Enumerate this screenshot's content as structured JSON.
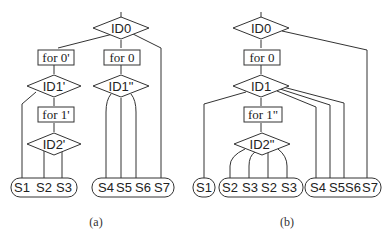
{
  "figure": {
    "a": {
      "caption": "(a)",
      "root": "ID0",
      "loops": [
        "for 0'",
        "for 0",
        "for 1'"
      ],
      "decisions": [
        "ID0",
        "ID1'",
        "ID1\"",
        "ID2'"
      ],
      "groups": [
        [
          "S1",
          "S2",
          "S3"
        ],
        [
          "S4",
          "S5",
          "S6",
          "S7"
        ]
      ]
    },
    "b": {
      "caption": "(b)",
      "root": "ID0",
      "loops": [
        "for 0",
        "for 1\""
      ],
      "decisions": [
        "ID0",
        "ID1",
        "ID2\""
      ],
      "groups": [
        [
          "S1"
        ],
        [
          "S2",
          "S3",
          "S2",
          "S3"
        ],
        [
          "S4",
          "S5",
          "S6",
          "S7"
        ]
      ]
    }
  }
}
